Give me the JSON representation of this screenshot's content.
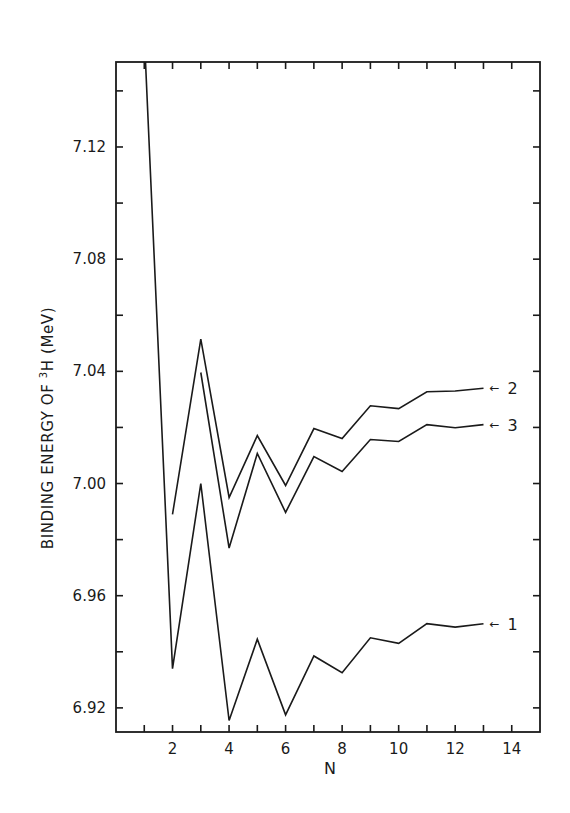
{
  "chart_data": {
    "type": "line",
    "title": "",
    "xlabel": "N",
    "ylabel": "BINDING ENERGY OF ³H (MeV)",
    "ylabel_parts": {
      "pre": "BINDING ENERGY OF ",
      "sup": "3",
      "post": "H  (MeV)"
    },
    "xlim": [
      0,
      15
    ],
    "ylim": [
      6.9114,
      7.1503
    ],
    "x_ticks": [
      1,
      2,
      3,
      4,
      5,
      6,
      7,
      8,
      9,
      10,
      11,
      12,
      13,
      14
    ],
    "x_tick_labels": [
      "2",
      "4",
      "6",
      "8",
      "10",
      "12",
      "14"
    ],
    "x_tick_label_values": [
      2,
      4,
      6,
      8,
      10,
      12,
      14
    ],
    "y_ticks": [
      6.94,
      6.98,
      7.02,
      7.06,
      7.1,
      7.14
    ],
    "y_tick_labels": [
      "6.92",
      "6.96",
      "7.00",
      "7.04",
      "7.08",
      "7.12"
    ],
    "y_tick_label_values": [
      6.92,
      6.96,
      7.0,
      7.04,
      7.08,
      7.12
    ],
    "grid": false,
    "legend": "inline labels at right end of each curve",
    "series": [
      {
        "name": "1",
        "label": "1",
        "x": [
          1,
          2,
          3,
          4,
          5,
          6,
          7,
          8,
          9,
          10,
          11,
          12,
          13
        ],
        "values": [
          7.16,
          6.934,
          7.0,
          6.9155,
          6.9445,
          6.9175,
          6.9385,
          6.9325,
          6.945,
          6.943,
          6.95,
          6.9488,
          6.95
        ]
      },
      {
        "name": "2",
        "label": "2",
        "x": [
          2,
          3,
          4,
          5,
          6,
          7,
          8,
          9,
          10,
          11,
          12,
          13
        ],
        "values": [
          6.989,
          7.0515,
          6.995,
          7.0171,
          6.9993,
          7.0196,
          7.016,
          7.0277,
          7.0267,
          7.0327,
          7.033,
          7.034
        ]
      },
      {
        "name": "3",
        "label": "3",
        "x": [
          3,
          4,
          5,
          6,
          7,
          8,
          9,
          10,
          11,
          12,
          13
        ],
        "values": [
          7.0396,
          6.977,
          7.0107,
          6.9897,
          7.0096,
          7.0043,
          7.0157,
          7.015,
          7.021,
          7.0199,
          7.021
        ]
      }
    ],
    "annotations": [
      {
        "text": "2",
        "arrow": "←",
        "series": "2"
      },
      {
        "text": "3",
        "arrow": "←",
        "series": "3"
      },
      {
        "text": "1",
        "arrow": "←",
        "series": "1"
      }
    ]
  }
}
